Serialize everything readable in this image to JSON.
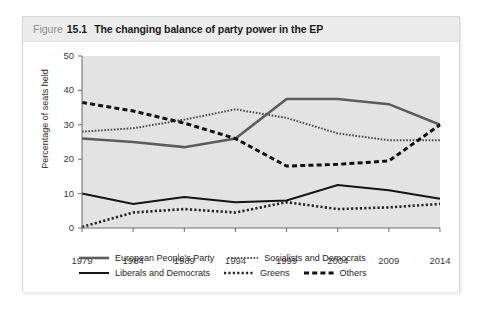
{
  "figure": {
    "label_word": "Figure",
    "number": "15.1",
    "title": "The changing balance of party power in the EP"
  },
  "chart_data": {
    "type": "line",
    "title": "The changing balance of party power in the EP",
    "xlabel": "",
    "ylabel": "Percentage of seats held",
    "categories": [
      "1979",
      "1984",
      "1989",
      "1994",
      "1999",
      "2004",
      "2009",
      "2014"
    ],
    "x": [
      1979,
      1984,
      1989,
      1994,
      1999,
      2004,
      2009,
      2014
    ],
    "xlim": [
      1979,
      2014
    ],
    "ylim": [
      0,
      50
    ],
    "yticks": [
      0,
      10,
      20,
      30,
      40,
      50
    ],
    "grid": false,
    "legend_position": "below",
    "plot_background": "#e3e3e3",
    "series": [
      {
        "name": "European People's Party",
        "style": "solid-thick-gray",
        "color": "#5c5c5c",
        "values": [
          26.0,
          25.0,
          23.5,
          26.0,
          37.5,
          37.5,
          36.0,
          30.0
        ]
      },
      {
        "name": "Socialists and Democrats",
        "style": "fine-dotted",
        "color": "#4a4a4a",
        "values": [
          28.0,
          29.0,
          31.5,
          34.5,
          32.0,
          27.5,
          25.5,
          25.5
        ]
      },
      {
        "name": "Liberals and Democrats",
        "style": "solid-thin-black",
        "color": "#141414",
        "values": [
          10.0,
          7.0,
          9.0,
          7.5,
          8.0,
          12.5,
          11.0,
          8.5
        ]
      },
      {
        "name": "Greens",
        "style": "dotted",
        "color": "#262626",
        "values": [
          0.3,
          4.5,
          5.5,
          4.5,
          7.5,
          5.5,
          6.0,
          7.0
        ]
      },
      {
        "name": "Others",
        "style": "dashed-thick",
        "color": "#111111",
        "values": [
          36.5,
          34.0,
          30.5,
          26.0,
          18.0,
          18.5,
          19.5,
          30.0
        ]
      }
    ]
  },
  "legend": {
    "rows": [
      [
        {
          "label": "European People's Party",
          "swatch": "solid-thick-gray"
        },
        {
          "label": "Socialists and Democrats",
          "swatch": "fine-dotted"
        }
      ],
      [
        {
          "label": "Liberals and Democrats",
          "swatch": "solid-thin-black"
        },
        {
          "label": "Greens",
          "swatch": "dotted"
        },
        {
          "label": "Others",
          "swatch": "dashed-thick"
        }
      ]
    ]
  }
}
